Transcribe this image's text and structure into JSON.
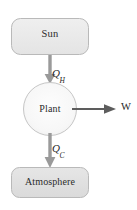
{
  "diagram": {
    "type": "energy-flow-block-diagram",
    "nodes": [
      {
        "id": "sun",
        "label": "Sun",
        "shape": "rounded-rectangle",
        "fill": "#e8e8e8",
        "stroke": "#b8b8b8",
        "x": 11,
        "y": 18,
        "width": 78,
        "height": 37
      },
      {
        "id": "plant",
        "label": "Plant",
        "shape": "circle",
        "fill": "#fafafa",
        "stroke": "#c2c2c2",
        "cx": 50,
        "cy": 109,
        "r": 27
      },
      {
        "id": "atmosphere",
        "label": "Atmosphere",
        "shape": "rounded-rectangle",
        "fill": "#e0e0e0",
        "stroke": "#b8b8b8",
        "x": 11,
        "y": 167,
        "width": 78,
        "height": 31
      }
    ],
    "arrows": [
      {
        "id": "qh-arrow",
        "from": "sun",
        "to": "plant",
        "direction": "down",
        "label_base": "Q",
        "label_sub": "H",
        "color": "#8a8a8a"
      },
      {
        "id": "w-arrow",
        "from": "plant",
        "to": "work-output",
        "direction": "right",
        "label_base": "W",
        "label_sub": "",
        "color": "#5a5a5a"
      },
      {
        "id": "qc-arrow",
        "from": "plant",
        "to": "atmosphere",
        "direction": "down",
        "label_base": "Q",
        "label_sub": "C",
        "color": "#8a8a8a"
      }
    ],
    "labels": {
      "sun": "Sun",
      "plant": "Plant",
      "atmosphere": "Atmosphere",
      "q_hot_base": "Q",
      "q_hot_sub": "H",
      "q_cold_base": "Q",
      "q_cold_sub": "C",
      "work": "W"
    },
    "colors": {
      "background": "#ffffff",
      "box_fill_light": "#e8e8e8",
      "box_fill_dark": "#e0e0e0",
      "box_stroke": "#b8b8b8",
      "circle_fill": "#fafafa",
      "circle_stroke": "#c2c2c2",
      "arrow_gray": "#8a8a8a",
      "arrow_dark": "#5a5a5a",
      "text": "#2b2b2b"
    }
  }
}
